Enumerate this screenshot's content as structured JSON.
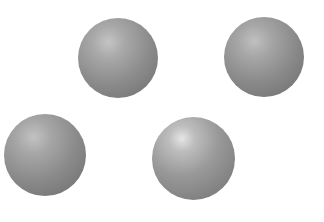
{
  "image": {
    "description": "Four grey shaded spheres on a white background",
    "background_color": "#ffffff",
    "objects": [
      {
        "type": "sphere",
        "label": "sphere-top-middle",
        "color": "#8c8c8c"
      },
      {
        "type": "sphere",
        "label": "sphere-top-right",
        "color": "#8a8a8a"
      },
      {
        "type": "sphere",
        "label": "sphere-bottom-left",
        "color": "#8a8a8a"
      },
      {
        "type": "sphere",
        "label": "sphere-bottom-middle",
        "color": "#999999"
      }
    ]
  }
}
